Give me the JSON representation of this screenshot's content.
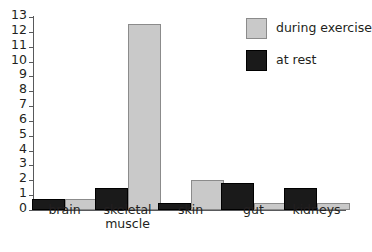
{
  "chart_data": {
    "type": "bar",
    "title": "",
    "subtitle": "",
    "xlabel": "",
    "ylabel": "",
    "categories": [
      "brain",
      "skeletal\nmuscle",
      "skin",
      "gut",
      "kidneys"
    ],
    "series": [
      {
        "name": "at rest",
        "color": "#1a1a1a",
        "values": [
          0.75,
          1.5,
          0.45,
          1.8,
          1.5
        ]
      },
      {
        "name": "during exercise",
        "color": "#c9c9c9",
        "values": [
          0.75,
          12.5,
          2.0,
          0.45,
          0.45
        ]
      }
    ],
    "series_draw_order": [
      "at rest",
      "during exercise"
    ],
    "ylim": [
      0,
      13
    ],
    "y_ticks": [
      0,
      1,
      2,
      3,
      4,
      5,
      6,
      7,
      8,
      9,
      10,
      11,
      12,
      13
    ],
    "y_tick_labels": [
      "0",
      "1",
      "2",
      "3",
      "4",
      "5",
      "6",
      "7",
      "8",
      "9",
      "10",
      "11",
      "12",
      "13"
    ],
    "grid": false,
    "legend_position": "top-right",
    "legend_entries": [
      {
        "label": "during exercise",
        "color": "#c9c9c9",
        "swatch": "exercise"
      },
      {
        "label": "at rest",
        "color": "#1a1a1a",
        "swatch": "rest"
      }
    ],
    "axis_color": "#58595b",
    "background": "#ffffff"
  }
}
